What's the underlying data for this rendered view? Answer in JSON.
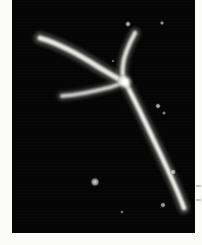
{
  "figure": {
    "kind": "micrograph",
    "modality": "atomic-force / electron micrograph",
    "background_color": "#050505",
    "filament_color": "#f2f2ee",
    "paper_color": "#fbfbf9",
    "frame": {
      "x": 12,
      "y": 0,
      "width": 183,
      "height": 233
    }
  },
  "structures": {
    "junction": {
      "label": "central-junction",
      "x": 113,
      "y": 82
    },
    "branches": [
      {
        "label": "upper-left-branch",
        "path": "M 28 38 C 45 43, 68 55, 88 68 C 98 74, 106 79, 113 82",
        "width": 5.2,
        "brightness": 0.95
      },
      {
        "label": "left-horizontal-branch",
        "path": "M 50 96 C 66 95, 84 91, 99 87 C 105 85, 110 83, 113 82",
        "width": 4.0,
        "brightness": 0.82
      },
      {
        "label": "upper-right-branch",
        "path": "M 123 33 C 117 44, 112 55, 111 65 C 110 72, 111 78, 113 82",
        "width": 4.6,
        "brightness": 0.9
      },
      {
        "label": "long-descending-branch",
        "path": "M 113 82 C 123 100, 134 124, 146 149 C 157 172, 166 192, 172 208",
        "width": 4.8,
        "brightness": 0.98
      }
    ],
    "specks": [
      {
        "label": "speck-top-left-of-branch",
        "x": 116,
        "y": 24,
        "r": 3.2,
        "brightness": 0.8
      },
      {
        "label": "speck-top-right",
        "x": 150,
        "y": 23,
        "r": 2.4,
        "brightness": 0.7
      },
      {
        "label": "speck-mid-right-a",
        "x": 146,
        "y": 106,
        "r": 3.0,
        "brightness": 0.78
      },
      {
        "label": "speck-mid-right-b",
        "x": 152,
        "y": 113,
        "r": 2.2,
        "brightness": 0.62
      },
      {
        "label": "speck-center-lower",
        "x": 83,
        "y": 182,
        "r": 5.0,
        "brightness": 0.85
      },
      {
        "label": "speck-lower-right-a",
        "x": 161,
        "y": 172,
        "r": 3.4,
        "brightness": 0.8
      },
      {
        "label": "speck-lower-right-b",
        "x": 151,
        "y": 205,
        "r": 3.0,
        "brightness": 0.74
      },
      {
        "label": "speck-bottom-center",
        "x": 110,
        "y": 212,
        "r": 2.0,
        "brightness": 0.55
      },
      {
        "label": "speck-near-junction",
        "x": 101,
        "y": 61,
        "r": 1.8,
        "brightness": 0.5
      }
    ]
  },
  "margin_ticks": [
    {
      "label": "edge-tick-upper",
      "y": 185
    },
    {
      "label": "edge-tick-lower",
      "y": 199
    }
  ]
}
